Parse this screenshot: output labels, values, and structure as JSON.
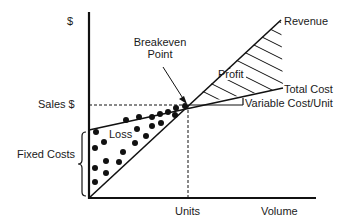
{
  "diagram": {
    "y_axis_label": "$",
    "x_axis_units_label": "Units",
    "x_axis_label": "Volume",
    "sales_label": "Sales $",
    "fixed_costs_label": "Fixed Costs",
    "loss_label": "Loss",
    "profit_label": "Profit",
    "breakeven_label_line1": "Breakeven",
    "breakeven_label_line2": "Point",
    "revenue_label": "Revenue",
    "total_cost_label": "Total Cost",
    "variable_cost_label": "Variable Cost/Unit"
  },
  "colors": {
    "line": "#111111",
    "background": "#ffffff"
  }
}
